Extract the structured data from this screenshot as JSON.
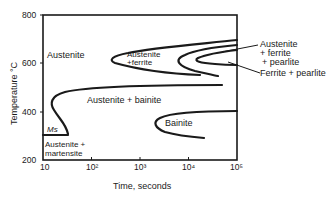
{
  "diagram": {
    "type": "TTT diagram (isothermal transformation)",
    "y_axis": {
      "label": "Temperature °C",
      "ticks": [
        "800",
        "600",
        "400",
        "200"
      ],
      "range": [
        200,
        800
      ]
    },
    "x_axis": {
      "label": "Time, seconds",
      "ticks": [
        "10",
        "10²",
        "10³",
        "10⁴",
        "10⁵"
      ],
      "scale": "log",
      "range": [
        10,
        100000
      ]
    },
    "regions": {
      "austenite": "Austenite",
      "austenite_ferrite_1": "Austenite",
      "austenite_ferrite_2": "+ferrite",
      "austenite_bainite": "Austenite + bainite",
      "bainite": "Bainite",
      "ms": "Ms",
      "austenite_martensite_1": "Austenite +",
      "austenite_martensite_2": "martensite"
    },
    "callouts": {
      "afp_1": "Austenite",
      "afp_2": "+ ferrite",
      "afp_3": "+ pearlite",
      "fp": "Ferrite + pearlite"
    }
  }
}
